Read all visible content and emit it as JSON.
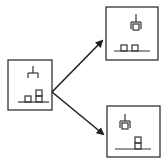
{
  "diagram": {
    "type": "state-transition",
    "colors": {
      "stroke": "#222222",
      "background": "#ffffff"
    },
    "nodes": [
      {
        "id": "initial-state",
        "description": "Open gripper above ground; one single block and one two-block stack",
        "box": [
          8,
          60,
          44,
          50
        ]
      },
      {
        "id": "outcome-top",
        "description": "Gripper holding a block; two single blocks on ground",
        "box": [
          106,
          7,
          52,
          53
        ]
      },
      {
        "id": "outcome-bottom",
        "description": "Gripper holding a block; one two-block stack on ground",
        "box": [
          107,
          106,
          53,
          51
        ]
      }
    ],
    "edges": [
      {
        "from": "initial-state",
        "to": "outcome-top"
      },
      {
        "from": "initial-state",
        "to": "outcome-bottom"
      }
    ]
  }
}
